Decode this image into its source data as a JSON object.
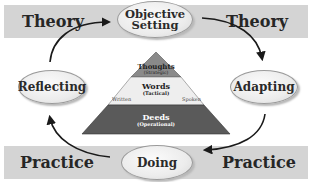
{
  "bands": {
    "top": {
      "left_label": "Theory",
      "right_label": "Theory"
    },
    "bottom": {
      "left_label": "Practice",
      "right_label": "Practice"
    }
  },
  "cycle_nodes": [
    {
      "id": "objective-setting",
      "line1": "Objective",
      "line2": "Setting"
    },
    {
      "id": "adapting",
      "label": "Adapting"
    },
    {
      "id": "doing",
      "label": "Doing"
    },
    {
      "id": "reflecting",
      "label": "Reflecting"
    }
  ],
  "pyramid": {
    "top": {
      "title": "Thoughts",
      "subtitle": "(Strategic)"
    },
    "middle": {
      "title": "Words",
      "subtitle": "(Tactical)",
      "left_note": "Written",
      "right_note": "Spoken"
    },
    "bottom": {
      "title": "Deeds",
      "subtitle": "(Operational)"
    }
  },
  "colors": {
    "band": "#d4d4d4",
    "pyramid_top": "#8a8a8a",
    "pyramid_middle": "#eeeeee",
    "pyramid_bottom": "#5a5a5a",
    "arrow": "#1a1a1a"
  }
}
